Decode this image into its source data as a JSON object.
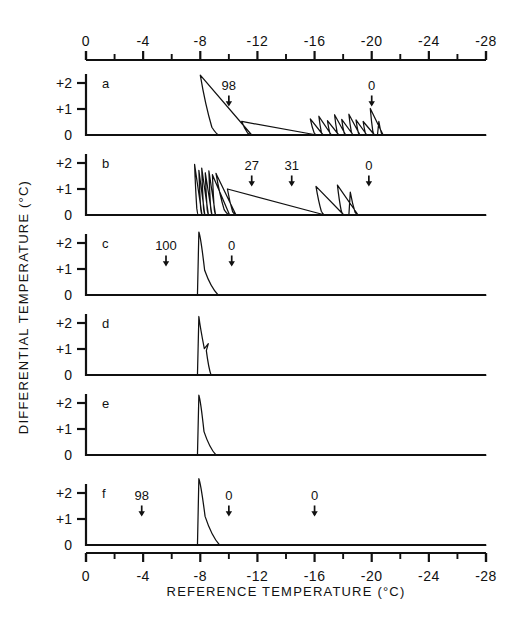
{
  "figure": {
    "title": "",
    "background": "#ffffff",
    "ink": "#111111"
  },
  "axes": {
    "x_label": "REFERENCE  TEMPERATURE  (°C)",
    "y_label": "DIFFERENTIAL  TEMPERATURE  (°C)",
    "x_ticks_major": [
      "0",
      "-4",
      "-8",
      "-12",
      "-16",
      "-20",
      "-24",
      "-28"
    ],
    "x_major_values": [
      0,
      -4,
      -8,
      -12,
      -16,
      -20,
      -24,
      -28
    ],
    "x_minor_step": 2,
    "x_range": [
      0,
      -28
    ],
    "y_ticks": [
      "+2",
      "+1",
      "0"
    ],
    "y_values": [
      2,
      1,
      0
    ],
    "y_range": [
      0,
      2.35
    ],
    "top_axis": true,
    "bottom_axis": true
  },
  "chart_data": {
    "type": "line",
    "xlabel": "REFERENCE  TEMPERATURE  (°C)",
    "ylabel": "DIFFERENTIAL  TEMPERATURE  (°C)",
    "xlim": [
      0,
      -28
    ],
    "ylim": [
      0,
      2.35
    ],
    "grid": false,
    "legend": "none",
    "panels": [
      {
        "id": "a",
        "label": "a",
        "annotations": [
          {
            "text": "98",
            "x": -10.0
          },
          {
            "text": "0",
            "x": -20.0
          }
        ],
        "peaks": [
          {
            "x": -8.0,
            "height": 2.3,
            "rise": 0.12,
            "decay": 1.35
          },
          {
            "x": -10.9,
            "height": 0.52,
            "rise": 0.1,
            "decay": 0.7
          },
          {
            "x": -15.7,
            "height": 0.62,
            "rise": 0.09,
            "decay": 0.45
          },
          {
            "x": -16.3,
            "height": 0.72,
            "rise": 0.08,
            "decay": 0.3
          },
          {
            "x": -16.9,
            "height": 0.55,
            "rise": 0.08,
            "decay": 0.28
          },
          {
            "x": -17.4,
            "height": 0.78,
            "rise": 0.08,
            "decay": 0.3
          },
          {
            "x": -17.9,
            "height": 0.6,
            "rise": 0.08,
            "decay": 0.28
          },
          {
            "x": -18.4,
            "height": 0.8,
            "rise": 0.08,
            "decay": 0.3
          },
          {
            "x": -18.9,
            "height": 0.58,
            "rise": 0.08,
            "decay": 0.28
          },
          {
            "x": -19.4,
            "height": 0.52,
            "rise": 0.08,
            "decay": 0.26
          },
          {
            "x": -19.9,
            "height": 1.02,
            "rise": 0.08,
            "decay": 0.3
          },
          {
            "x": -20.5,
            "height": 0.52,
            "rise": 0.08,
            "decay": 0.3
          }
        ]
      },
      {
        "id": "b",
        "label": "b",
        "annotations": [
          {
            "text": "27",
            "x": -11.6
          },
          {
            "text": "31",
            "x": -14.4
          },
          {
            "text": "0",
            "x": -19.8
          }
        ],
        "peaks": [
          {
            "x": -7.6,
            "height": 1.95,
            "rise": 0.07,
            "decay": 0.26
          },
          {
            "x": -7.9,
            "height": 1.72,
            "rise": 0.06,
            "decay": 0.22
          },
          {
            "x": -8.1,
            "height": 1.8,
            "rise": 0.06,
            "decay": 0.22
          },
          {
            "x": -8.35,
            "height": 1.62,
            "rise": 0.06,
            "decay": 0.22
          },
          {
            "x": -8.6,
            "height": 1.7,
            "rise": 0.06,
            "decay": 0.22
          },
          {
            "x": -8.85,
            "height": 1.55,
            "rise": 0.06,
            "decay": 0.22
          },
          {
            "x": -9.1,
            "height": 1.6,
            "rise": 0.07,
            "decay": 0.95
          },
          {
            "x": -9.9,
            "height": 1.0,
            "rise": 0.08,
            "decay": 0.6
          },
          {
            "x": -16.1,
            "height": 1.1,
            "rise": 0.09,
            "decay": 0.62
          },
          {
            "x": -17.6,
            "height": 1.15,
            "rise": 0.09,
            "decay": 0.45
          },
          {
            "x": -18.5,
            "height": 0.88,
            "rise": 0.09,
            "decay": 0.55
          }
        ]
      },
      {
        "id": "c",
        "label": "c",
        "annotations": [
          {
            "text": "100",
            "x": -5.6
          },
          {
            "text": "0",
            "x": -10.2
          }
        ],
        "peaks": [
          {
            "x": -7.9,
            "height": 2.42,
            "rise": 0.07,
            "decay": 1.35,
            "shoulder": 0.95
          }
        ]
      },
      {
        "id": "d",
        "label": "d",
        "annotations": [],
        "peaks": [
          {
            "x": -7.9,
            "height": 2.25,
            "rise": 0.07,
            "decay": 0.85,
            "notch": true
          }
        ]
      },
      {
        "id": "e",
        "label": "e",
        "annotations": [],
        "peaks": [
          {
            "x": -7.9,
            "height": 2.3,
            "rise": 0.07,
            "decay": 1.2,
            "shoulder": 0.9
          }
        ]
      },
      {
        "id": "f",
        "label": "f",
        "annotations": [
          {
            "text": "98",
            "x": -3.9
          },
          {
            "text": "0",
            "x": -10.0
          },
          {
            "text": "0",
            "x": -16.0
          }
        ],
        "peaks": [
          {
            "x": -7.9,
            "height": 2.55,
            "rise": 0.07,
            "decay": 1.45,
            "shoulder": 1.1
          }
        ]
      }
    ]
  }
}
